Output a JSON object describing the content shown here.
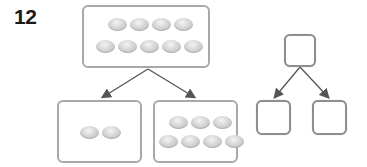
{
  "problem": {
    "number": "12"
  },
  "example_bond": {
    "whole": {
      "count": 9,
      "rows": [
        4,
        5
      ]
    },
    "parts": [
      {
        "count": 2,
        "rows": [
          2
        ]
      },
      {
        "count": 7,
        "rows": [
          3,
          4
        ]
      }
    ]
  },
  "answer_bond": {
    "whole": {
      "value": ""
    },
    "parts": [
      {
        "value": ""
      },
      {
        "value": ""
      }
    ]
  },
  "colors": {
    "box_border": "#a9a9a9",
    "square_border": "#8e8e8e",
    "arrow": "#555555",
    "bean": "#cfcfcf"
  }
}
